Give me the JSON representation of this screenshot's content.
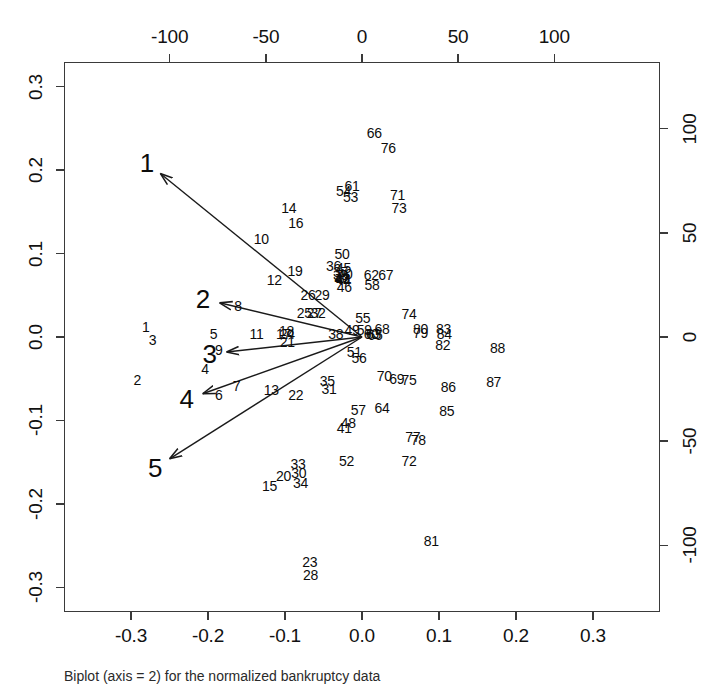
{
  "caption": "Biplot (axis = 2) for the normalized bankruptcy data",
  "chart_data": {
    "type": "scatter",
    "title": "",
    "subtitle": "",
    "xlabel": "",
    "ylabel": "",
    "grid": false,
    "legend": "none",
    "axes": {
      "bottom": {
        "name": "component-1-loadings",
        "ticks": [
          -0.3,
          -0.2,
          -0.1,
          0.0,
          0.1,
          0.2,
          0.3
        ],
        "ticklabels": [
          "-0.3",
          "-0.2",
          "-0.1",
          "0.0",
          "0.1",
          "0.2",
          "0.3"
        ],
        "lim": [
          -0.3871,
          0.3871
        ]
      },
      "left": {
        "name": "component-2-loadings",
        "ticks": [
          -0.3,
          -0.2,
          -0.1,
          0.0,
          0.1,
          0.2,
          0.3
        ],
        "ticklabels": [
          "-0.3",
          "-0.2",
          "-0.1",
          "0.0",
          "0.1",
          "0.2",
          "0.3"
        ],
        "lim": [
          -0.3295,
          0.3295
        ]
      },
      "top": {
        "name": "component-1-scores",
        "ticks": [
          -100,
          -50,
          0,
          50,
          100
        ],
        "ticklabels": [
          "-100",
          "-50",
          "0",
          "50",
          "100"
        ],
        "lim": [
          -155,
          155
        ]
      },
      "right": {
        "name": "component-2-scores",
        "ticks": [
          -100,
          -50,
          0,
          50,
          100
        ],
        "ticklabels": [
          "-100",
          "-50",
          "0",
          "50",
          "100"
        ],
        "lim": [
          -132,
          132
        ]
      }
    },
    "points": [
      {
        "label": "1",
        "x": -0.281,
        "y": 0.012
      },
      {
        "label": "2",
        "x": -0.292,
        "y": -0.052
      },
      {
        "label": "3",
        "x": -0.272,
        "y": -0.004
      },
      {
        "label": "4",
        "x": -0.204,
        "y": -0.038
      },
      {
        "label": "5",
        "x": -0.193,
        "y": 0.004
      },
      {
        "label": "6",
        "x": -0.186,
        "y": -0.07
      },
      {
        "label": "7",
        "x": -0.163,
        "y": -0.059
      },
      {
        "label": "8",
        "x": -0.161,
        "y": 0.037
      },
      {
        "label": "9",
        "x": -0.186,
        "y": -0.016
      },
      {
        "label": "10",
        "x": -0.131,
        "y": 0.118
      },
      {
        "label": "11",
        "x": -0.137,
        "y": 0.004
      },
      {
        "label": "12",
        "x": -0.114,
        "y": 0.068
      },
      {
        "label": "13",
        "x": -0.118,
        "y": -0.063
      },
      {
        "label": "14",
        "x": -0.095,
        "y": 0.155
      },
      {
        "label": "15",
        "x": -0.12,
        "y": -0.179
      },
      {
        "label": "16",
        "x": -0.086,
        "y": 0.136
      },
      {
        "label": "17",
        "x": -0.102,
        "y": 0.003
      },
      {
        "label": "18",
        "x": -0.098,
        "y": 0.007
      },
      {
        "label": "19",
        "x": -0.087,
        "y": 0.079
      },
      {
        "label": "20",
        "x": -0.102,
        "y": -0.166
      },
      {
        "label": "21",
        "x": -0.097,
        "y": -0.006
      },
      {
        "label": "22",
        "x": -0.086,
        "y": -0.069
      },
      {
        "label": "23",
        "x": -0.068,
        "y": -0.27
      },
      {
        "label": "24",
        "x": -0.097,
        "y": 0.003
      },
      {
        "label": "25",
        "x": -0.075,
        "y": 0.029
      },
      {
        "label": "26",
        "x": -0.07,
        "y": 0.05
      },
      {
        "label": "27",
        "x": -0.062,
        "y": 0.029
      },
      {
        "label": "28",
        "x": -0.067,
        "y": -0.285
      },
      {
        "label": "29",
        "x": -0.052,
        "y": 0.05
      },
      {
        "label": "30",
        "x": -0.082,
        "y": -0.163
      },
      {
        "label": "31",
        "x": -0.043,
        "y": -0.062
      },
      {
        "label": "32",
        "x": -0.057,
        "y": 0.029
      },
      {
        "label": "33",
        "x": -0.083,
        "y": -0.152
      },
      {
        "label": "34",
        "x": -0.08,
        "y": -0.175
      },
      {
        "label": "35",
        "x": -0.045,
        "y": -0.053
      },
      {
        "label": "36",
        "x": -0.037,
        "y": 0.085
      },
      {
        "label": "37",
        "x": -0.028,
        "y": 0.078
      },
      {
        "label": "38",
        "x": -0.034,
        "y": 0.004
      },
      {
        "label": "39",
        "x": -0.028,
        "y": 0.074
      },
      {
        "label": "40",
        "x": -0.022,
        "y": 0.075
      },
      {
        "label": "41",
        "x": -0.023,
        "y": -0.109
      },
      {
        "label": "42",
        "x": -0.025,
        "y": 0.07
      },
      {
        "label": "43",
        "x": -0.026,
        "y": 0.071
      },
      {
        "label": "44",
        "x": -0.024,
        "y": 0.068
      },
      {
        "label": "45",
        "x": -0.024,
        "y": 0.083
      },
      {
        "label": "46",
        "x": -0.023,
        "y": 0.06
      },
      {
        "label": "47",
        "x": -0.026,
        "y": 0.069
      },
      {
        "label": "48",
        "x": -0.018,
        "y": -0.103
      },
      {
        "label": "49",
        "x": -0.013,
        "y": 0.008
      },
      {
        "label": "50",
        "x": -0.026,
        "y": 0.1
      },
      {
        "label": "51",
        "x": -0.01,
        "y": -0.018
      },
      {
        "label": "52",
        "x": -0.02,
        "y": -0.149
      },
      {
        "label": "53",
        "x": -0.015,
        "y": 0.168
      },
      {
        "label": "54",
        "x": -0.024,
        "y": 0.175
      },
      {
        "label": "55",
        "x": 0.001,
        "y": 0.023
      },
      {
        "label": "56",
        "x": -0.004,
        "y": -0.025
      },
      {
        "label": "57",
        "x": -0.005,
        "y": -0.088
      },
      {
        "label": "58",
        "x": 0.013,
        "y": 0.062
      },
      {
        "label": "59",
        "x": 0.003,
        "y": 0.008
      },
      {
        "label": "60",
        "x": 0.012,
        "y": 0.004
      },
      {
        "label": "61",
        "x": -0.013,
        "y": 0.181
      },
      {
        "label": "62",
        "x": 0.012,
        "y": 0.074
      },
      {
        "label": "63",
        "x": 0.015,
        "y": 0.003
      },
      {
        "label": "64",
        "x": 0.026,
        "y": -0.085
      },
      {
        "label": "65",
        "x": 0.017,
        "y": 0.002
      },
      {
        "label": "66",
        "x": 0.016,
        "y": 0.244
      },
      {
        "label": "67",
        "x": 0.031,
        "y": 0.074
      },
      {
        "label": "68",
        "x": 0.026,
        "y": 0.01
      },
      {
        "label": "69",
        "x": 0.045,
        "y": -0.05
      },
      {
        "label": "70",
        "x": 0.029,
        "y": -0.047
      },
      {
        "label": "71",
        "x": 0.046,
        "y": 0.17
      },
      {
        "label": "72",
        "x": 0.061,
        "y": -0.148
      },
      {
        "label": "73",
        "x": 0.048,
        "y": 0.155
      },
      {
        "label": "74",
        "x": 0.061,
        "y": 0.027
      },
      {
        "label": "75",
        "x": 0.061,
        "y": -0.051
      },
      {
        "label": "76",
        "x": 0.034,
        "y": 0.227
      },
      {
        "label": "77",
        "x": 0.066,
        "y": -0.12
      },
      {
        "label": "78",
        "x": 0.073,
        "y": -0.124
      },
      {
        "label": "79",
        "x": 0.076,
        "y": 0.005
      },
      {
        "label": "80",
        "x": 0.076,
        "y": 0.009
      },
      {
        "label": "81",
        "x": 0.09,
        "y": -0.244
      },
      {
        "label": "82",
        "x": 0.105,
        "y": -0.01
      },
      {
        "label": "83",
        "x": 0.106,
        "y": 0.009
      },
      {
        "label": "84",
        "x": 0.107,
        "y": 0.004
      },
      {
        "label": "85",
        "x": 0.11,
        "y": -0.089
      },
      {
        "label": "86",
        "x": 0.112,
        "y": -0.06
      },
      {
        "label": "87",
        "x": 0.171,
        "y": -0.054
      },
      {
        "label": "88",
        "x": 0.176,
        "y": -0.013
      }
    ],
    "arrows": [
      {
        "label": "1",
        "tip_x": -0.262,
        "tip_y": 0.196,
        "origin_x": 0.0,
        "origin_y": 0.0
      },
      {
        "label": "2",
        "tip_x": -0.185,
        "tip_y": 0.041,
        "origin_x": 0.0,
        "origin_y": 0.0
      },
      {
        "label": "3",
        "tip_x": -0.176,
        "tip_y": -0.018,
        "origin_x": 0.0,
        "origin_y": 0.0
      },
      {
        "label": "4",
        "tip_x": -0.207,
        "tip_y": -0.068,
        "origin_x": 0.0,
        "origin_y": 0.0
      },
      {
        "label": "5",
        "tip_x": -0.25,
        "tip_y": -0.146,
        "origin_x": 0.0,
        "origin_y": 0.0
      }
    ],
    "arrow_origin": {
      "x": 0.0,
      "y": 0.0
    }
  },
  "colors": {
    "frame": "#3a3a3a",
    "text": "#0c0c0c",
    "arrow": "#1a1a1a",
    "background": "#ffffff"
  }
}
